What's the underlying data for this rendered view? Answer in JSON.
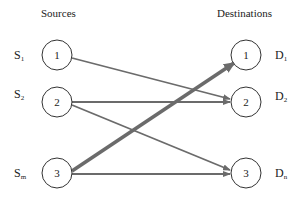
{
  "titles": {
    "sources": "Sources",
    "destinations": "Destinations"
  },
  "sources": [
    {
      "id": "1",
      "label": "S",
      "sub": "1",
      "cx": 57,
      "cy": 55
    },
    {
      "id": "2",
      "label": "S",
      "sub": "2",
      "cx": 57,
      "cy": 102
    },
    {
      "id": "3",
      "label": "S",
      "sub": "m",
      "cx": 57,
      "cy": 173
    }
  ],
  "destinations": [
    {
      "id": "1",
      "label": "D",
      "sub": "1",
      "cx": 246,
      "cy": 55
    },
    {
      "id": "2",
      "label": "D",
      "sub": "2",
      "cx": 246,
      "cy": 102
    },
    {
      "id": "3",
      "label": "D",
      "sub": "n",
      "cx": 246,
      "cy": 173
    }
  ],
  "edges": [
    {
      "from": "S1",
      "to": "D2",
      "weight": "thin"
    },
    {
      "from": "S2",
      "to": "D2",
      "weight": "thin"
    },
    {
      "from": "S2",
      "to": "D3",
      "weight": "thin"
    },
    {
      "from": "S3",
      "to": "D1",
      "weight": "thick"
    },
    {
      "from": "S3",
      "to": "D3",
      "weight": "thin"
    }
  ],
  "colors": {
    "edge": "#6b6b6b",
    "node_stroke": "#333333",
    "text": "#222222"
  }
}
